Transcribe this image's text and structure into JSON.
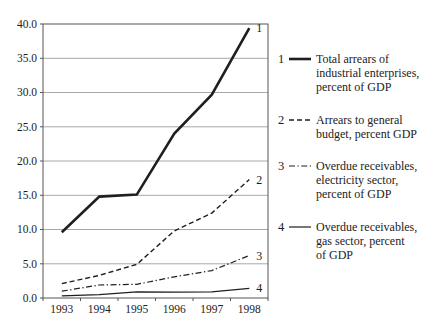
{
  "chart_data": {
    "type": "line",
    "x": [
      "1993",
      "1994",
      "1995",
      "1996",
      "1997",
      "1998"
    ],
    "ylim": [
      0,
      40
    ],
    "yticks": [
      "0.0",
      "5.0",
      "10.0",
      "15.0",
      "20.0",
      "25.0",
      "30.0",
      "35.0",
      "40.0"
    ],
    "grid": true,
    "legend_position": "right",
    "series": [
      {
        "id": "1",
        "name": "Total arrears of industrial enterprises, percent of GDP",
        "style": "solid",
        "width": 2.6,
        "values": [
          9.6,
          14.8,
          15.1,
          24.0,
          29.7,
          39.4
        ]
      },
      {
        "id": "2",
        "name": "Arrears to general budget, percent GDP",
        "style": "dashed",
        "width": 1.4,
        "values": [
          2.1,
          3.3,
          4.9,
          9.8,
          12.4,
          17.3
        ]
      },
      {
        "id": "3",
        "name": "Overdue receivables, electricity sector, percent of GDP",
        "style": "dashdot",
        "width": 1.2,
        "values": [
          1.0,
          1.9,
          2.0,
          3.1,
          4.0,
          6.2
        ]
      },
      {
        "id": "4",
        "name": "Overdue receivables, gas sector, percent of GDP",
        "style": "solid",
        "width": 1.2,
        "values": [
          0.3,
          0.5,
          0.9,
          0.85,
          0.9,
          1.4
        ]
      }
    ],
    "colors": {
      "line": "#1f1f1f",
      "grid": "#a8a8a8",
      "border": "#555555",
      "text": "#1c1c1c",
      "background": "#ffffff"
    }
  },
  "legend": {
    "items": [
      {
        "num": "1",
        "label": "Total arrears of\nindustrial enterprises,\npercent of GDP"
      },
      {
        "num": "2",
        "label": "Arrears to general\nbudget, percent GDP"
      },
      {
        "num": "3",
        "label": "Overdue receivables,\nelectricity sector,\npercent of GDP"
      },
      {
        "num": "4",
        "label": "Overdue receivables,\ngas sector, percent\nof GDP"
      }
    ]
  }
}
